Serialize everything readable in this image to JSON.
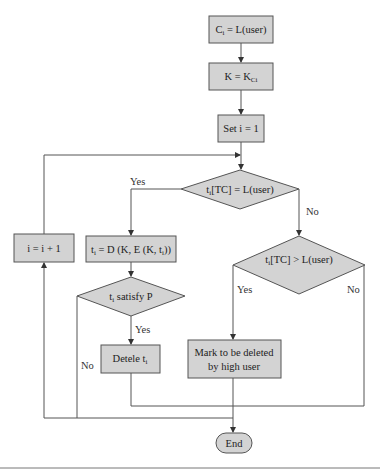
{
  "colors": {
    "node_fill": "#d3d3d3",
    "node_stroke": "#555555",
    "line": "#555555",
    "background": "#ffffff"
  },
  "nodes": {
    "ci_assign": {
      "main": "C",
      "sub": "i",
      "rest": " = L(user)"
    },
    "k_assign": {
      "main": "K = K",
      "sub": "Ci"
    },
    "set_i": {
      "text": "Set i = 1"
    },
    "decision_tc_equal": {
      "main": "t",
      "sub": "i",
      "rest": "[TC] = L(user)"
    },
    "increment_i": {
      "text": "i = i + 1"
    },
    "decrypt_ti": {
      "main": "t",
      "sub": "i",
      "rest": " = D (K, E (K, t",
      "sub2": "i",
      "rest2": "))"
    },
    "decision_tc_greater": {
      "main": "t",
      "sub": "i",
      "rest": "[TC] > L(user)"
    },
    "decision_satisfy": {
      "main": "t",
      "sub": "i",
      "rest": " satisfy P"
    },
    "delete_ti": {
      "main": "Detele t",
      "sub": "i"
    },
    "mark_deleted": {
      "line1": "Mark to be deleted",
      "line2": "by high user"
    },
    "end": {
      "text": "End"
    }
  },
  "edge_labels": {
    "tc_equal_yes": "Yes",
    "tc_equal_no": "No",
    "tc_greater_yes": "Yes",
    "tc_greater_no": "No",
    "satisfy_yes": "Yes",
    "satisfy_no": "No"
  }
}
